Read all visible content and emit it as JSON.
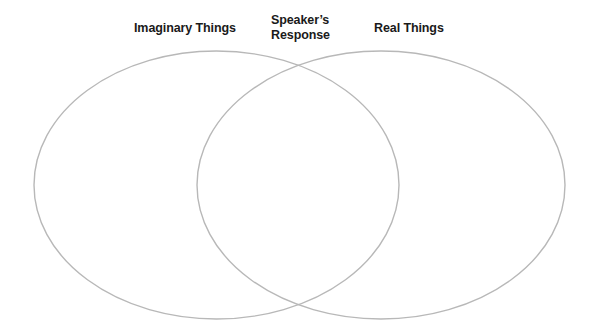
{
  "diagram": {
    "type": "venn",
    "labels": {
      "left": "Imaginary Things",
      "center_line1": "Speaker’s",
      "center_line2": "Response",
      "right": "Real Things"
    },
    "sets": [
      {
        "name": "Imaginary Things",
        "cx": 216.5,
        "cy": 185,
        "rx": 182.5,
        "ry": 134
      },
      {
        "name": "Real Things",
        "cx": 381,
        "cy": 185,
        "rx": 184,
        "ry": 134
      }
    ],
    "overlap": "Speaker’s Response",
    "colors": {
      "outline": "#b8b8b8",
      "text": "#1a1a1a",
      "background": "#ffffff"
    }
  }
}
